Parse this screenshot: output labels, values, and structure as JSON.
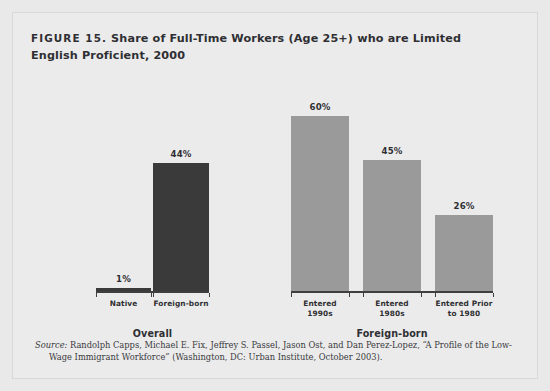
{
  "figure": {
    "label": "FIGURE 15.",
    "title": "Share of Full-Time Workers (Age 25+) who are Limited English Proficient, 2000"
  },
  "source": {
    "prefix": "Source:",
    "line1": "Randolph Capps, Michael E. Fix, Jeffrey S. Passel, Jason Ost, and Dan Perez-Lopez, “A Profile of the Low-",
    "line2": "Wage Immigrant Workforce” (Washington, DC: Urban Institute, October 2003)."
  },
  "colors": {
    "background": "#ebebeb",
    "page": "#e9e9e9",
    "bar_dark": "#3a3a3a",
    "bar_light": "#9a9a9a",
    "axis": "#3f3f3f",
    "text": "#2f2f33"
  },
  "chart_data": {
    "type": "bar",
    "title": "FIGURE 15. Share of Full-Time Workers (Age 25+) who are Limited English Proficient, 2000",
    "xlabel": "",
    "ylabel": "",
    "ylim": [
      0,
      60
    ],
    "grid": false,
    "legend": "none",
    "categories": [
      "Native",
      "Foreign-born",
      "Entered 1990s",
      "Entered 1980s",
      "Entered Prior to 1980"
    ],
    "values": [
      1,
      44,
      60,
      45,
      26
    ],
    "value_labels": [
      "1%",
      "44%",
      "60%",
      "45%",
      "26%"
    ],
    "bar_colors": [
      "#3a3a3a",
      "#3a3a3a",
      "#9a9a9a",
      "#9a9a9a",
      "#9a9a9a"
    ],
    "groups": [
      {
        "label": "Overall",
        "categories": [
          "Native",
          "Foreign-born"
        ]
      },
      {
        "label": "Foreign-born",
        "categories": [
          "Entered 1990s",
          "Entered 1980s",
          "Entered Prior to 1980"
        ]
      }
    ],
    "category_label_lines": [
      [
        "Native"
      ],
      [
        "Foreign-born"
      ],
      [
        "Entered",
        "1990s"
      ],
      [
        "Entered",
        "1980s"
      ],
      [
        "Entered Prior",
        "to 1980"
      ]
    ]
  }
}
